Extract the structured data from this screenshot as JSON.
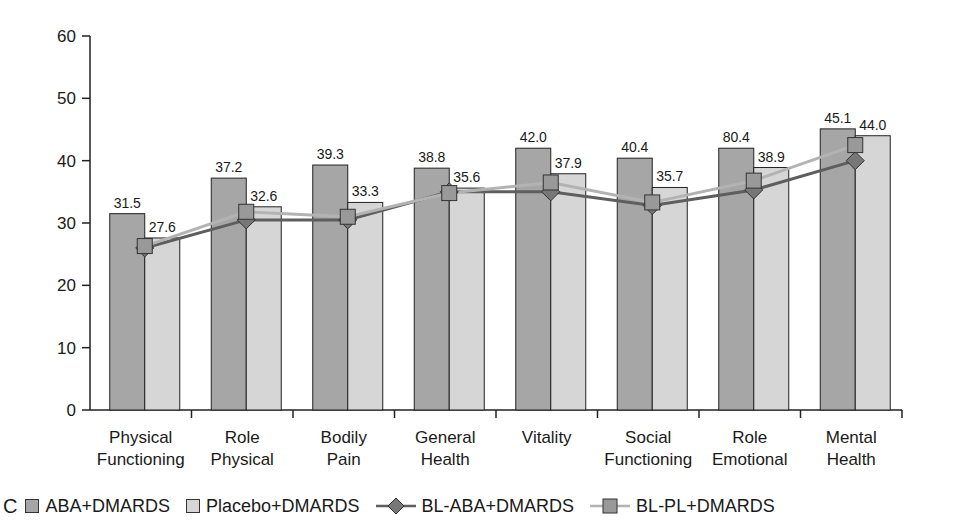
{
  "panel_label": "C",
  "colors": {
    "aba_bar": "#a6a6a6",
    "placebo_bar": "#d6d6d6",
    "bl_aba_line": "#5e5e5e",
    "bl_aba_marker": "#777777",
    "bl_pl_line": "#b3b3b3",
    "bl_pl_marker": "#999999"
  },
  "legend": {
    "aba": "ABA+DMARDS",
    "placebo": "Placebo+DMARDS",
    "bl_aba": "BL-ABA+DMARDS",
    "bl_pl": "BL-PL+DMARDS"
  },
  "chart_data": {
    "type": "bar",
    "title": "",
    "xlabel": "",
    "ylabel": "",
    "ylim": [
      0,
      60
    ],
    "yticks": [
      0,
      10,
      20,
      30,
      40,
      50,
      60
    ],
    "grid": false,
    "legend_position": "bottom",
    "categories": [
      [
        "Physical",
        "Functioning"
      ],
      [
        "Role",
        "Physical"
      ],
      [
        "Bodily",
        "Pain"
      ],
      [
        "General",
        "Health"
      ],
      [
        "Vitality",
        ""
      ],
      [
        "Social",
        "Functioning"
      ],
      [
        "Role",
        "Emotional"
      ],
      [
        "Mental",
        "Health"
      ]
    ],
    "series": [
      {
        "name": "ABA+DMARDS",
        "kind": "bar",
        "values": [
          31.5,
          37.2,
          39.3,
          38.8,
          42.0,
          40.4,
          42.0,
          45.1
        ],
        "labels": [
          "31.5",
          "37.2",
          "39.3",
          "38.8",
          "42.0",
          "40.4",
          "80.4",
          "45.1"
        ]
      },
      {
        "name": "Placebo+DMARDS",
        "kind": "bar",
        "values": [
          27.6,
          32.6,
          33.3,
          35.6,
          37.9,
          35.7,
          38.9,
          44.0
        ],
        "labels": [
          "27.6",
          "32.6",
          "33.3",
          "35.6",
          "37.9",
          "35.7",
          "38.9",
          "44.0"
        ]
      },
      {
        "name": "BL-ABA+DMARDS",
        "kind": "line",
        "marker": "diamond",
        "values": [
          26.0,
          30.5,
          30.5,
          35.0,
          35.0,
          32.8,
          35.3,
          40.0
        ]
      },
      {
        "name": "BL-PL+DMARDS",
        "kind": "line",
        "marker": "square",
        "values": [
          26.3,
          31.8,
          31.0,
          34.8,
          36.5,
          33.3,
          36.8,
          42.5
        ]
      }
    ]
  }
}
